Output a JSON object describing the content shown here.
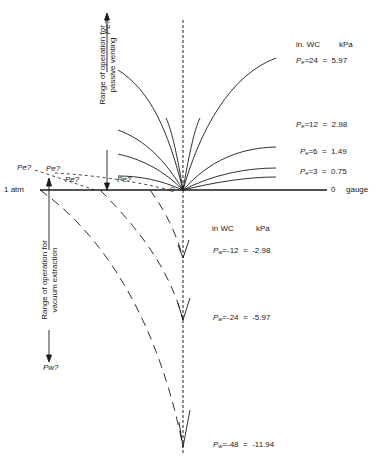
{
  "axis": {
    "left_label": "1 atm",
    "right_zero": "0",
    "right_label": "gauge",
    "origin_label": "0"
  },
  "positive_side": {
    "range_label_line1": "Range of operation for",
    "range_label_line2": "passive venting",
    "arrow_label": "Pe?",
    "unit_header_inwc": "in. WC",
    "unit_header_kpa": "kPa",
    "curves": [
      {
        "symbol": "P",
        "sub": "e",
        "inwc": "=24",
        "eq": "=",
        "kpa": "5.97"
      },
      {
        "symbol": "P",
        "sub": "e",
        "inwc": "=12",
        "eq": "=",
        "kpa": "2.98"
      },
      {
        "symbol": "P",
        "sub": "e",
        "inwc": "=6",
        "eq": "=",
        "kpa": "1.49"
      },
      {
        "symbol": "P",
        "sub": "e",
        "inwc": "=3",
        "eq": "=",
        "kpa": "0.75"
      }
    ],
    "question_labels": [
      "Pe?",
      "Pe?",
      "Pe?",
      "Pe?"
    ]
  },
  "negative_side": {
    "range_label_line1": "Range of operation for",
    "range_label_line2": "vacuum extraction",
    "arrow_label": "Pw?",
    "unit_header_inwc": "in WC",
    "unit_header_kpa": "kPa",
    "curves": [
      {
        "symbol": "P",
        "sub": "w",
        "inwc": "=-12",
        "eq": "=",
        "kpa": "-2.98"
      },
      {
        "symbol": "P",
        "sub": "w",
        "inwc": "=-24",
        "eq": "=",
        "kpa": "-5.97"
      },
      {
        "symbol": "P",
        "sub": "w",
        "inwc": "=-48",
        "eq": "=",
        "kpa": "-11.94"
      }
    ]
  },
  "colors": {
    "line": "#1a1a1a",
    "background": "#ffffff"
  }
}
